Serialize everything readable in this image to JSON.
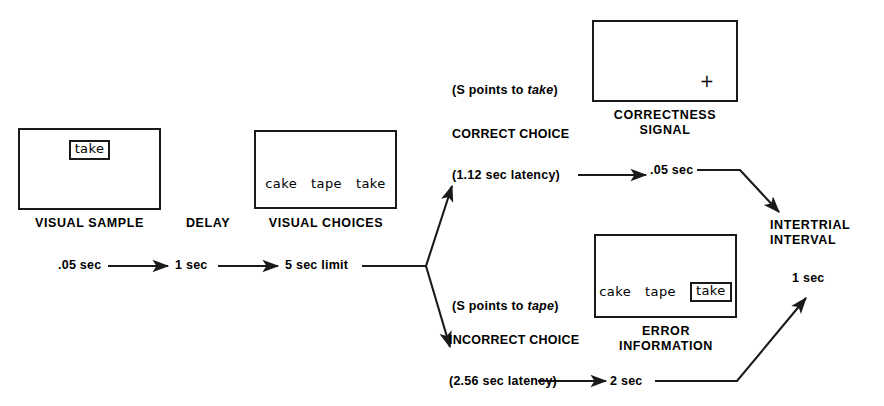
{
  "figure": {
    "type": "experimental-procedure-flowchart",
    "background_color": "#ffffff",
    "ink_color": "#1a1a1a"
  },
  "screens": {
    "visual_sample": {
      "caption": "VISUAL SAMPLE",
      "boxed_word": "take",
      "words": []
    },
    "visual_choices": {
      "caption": "VISUAL CHOICES",
      "words": [
        "cake",
        "tape",
        "take"
      ],
      "boxed_word": ""
    },
    "correctness_signal": {
      "caption": "CORRECTNESS\nSIGNAL",
      "mark": "+",
      "words": []
    },
    "error_information": {
      "caption": "ERROR\nINFORMATION",
      "words": [
        "cake",
        "tape"
      ],
      "boxed_word": "take"
    }
  },
  "stage_labels": {
    "delay": "DELAY",
    "intertrial_interval": "INTERTRIAL\nINTERVAL"
  },
  "timings": {
    "sample_duration": ".05 sec",
    "delay_duration": "1 sec",
    "choice_limit": "5 sec limit",
    "correctness_signal_duration": ".05 sec",
    "error_information_duration": "2 sec",
    "intertrial_duration": "1 sec"
  },
  "correct_branch": {
    "response_note_prefix": "(S points to ",
    "response_note_word": "take",
    "response_note_suffix": ")",
    "outcome_label": "CORRECT CHOICE",
    "latency_label": "(1.12 sec latency)"
  },
  "incorrect_branch": {
    "response_note_prefix": "(S points to ",
    "response_note_word": "tape",
    "response_note_suffix": ")",
    "outcome_label": "INCORRECT CHOICE",
    "latency_label": "(2.56 sec latency)"
  }
}
